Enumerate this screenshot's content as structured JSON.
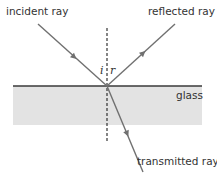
{
  "diagram": {
    "labels": {
      "incident": "incident ray",
      "reflected": "reflected ray",
      "transmitted": "transmitted ray",
      "medium": "glass",
      "angle_incidence": "i",
      "angle_reflection": "r"
    },
    "colors": {
      "ray": "#707070",
      "glass_fill": "#e3e3e3",
      "surface_line": "#3a3a3a",
      "normal": "#222222",
      "text": "#333333"
    }
  }
}
